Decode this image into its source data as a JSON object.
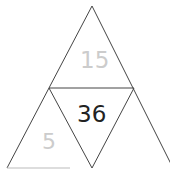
{
  "diagram": {
    "type": "triangle-puzzle",
    "line_color": "#444444",
    "cells": {
      "top": {
        "value": "15",
        "color": "#cccccc"
      },
      "center": {
        "value": "36",
        "color": "#222222"
      },
      "bottom_left": {
        "value": "5",
        "color": "#cccccc"
      },
      "bottom_right": {
        "value": "",
        "color": "#cccccc"
      }
    }
  }
}
